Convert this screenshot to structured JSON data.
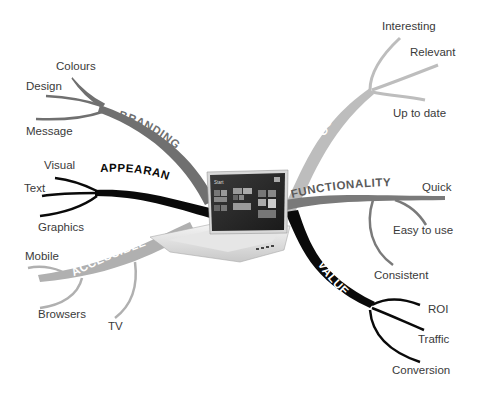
{
  "diagram": {
    "type": "mind-map",
    "center": {
      "label": "laptop",
      "screen_title": "Start"
    },
    "branches": [
      {
        "id": "branding",
        "label": "BRANDING",
        "color": "#707070",
        "text_color": "#707070",
        "children": [
          "Colours",
          "Design",
          "Message"
        ]
      },
      {
        "id": "appearance",
        "label": "APPEARANCE",
        "color": "#0a0a0a",
        "text_color": "#0a0a0a",
        "children": [
          "Visual",
          "Text",
          "Graphics"
        ]
      },
      {
        "id": "accessible",
        "label": "ACCESSIBLE",
        "color": "#b0b0b0",
        "text_color": "#ffffff",
        "children": [
          "Mobile",
          "Browsers",
          "TV"
        ]
      },
      {
        "id": "content",
        "label": "CONTENT",
        "color": "#bdbdbd",
        "text_color": "#ffffff",
        "children": [
          "Interesting",
          "Relevant",
          "Up to date"
        ]
      },
      {
        "id": "functionality",
        "label": "FUNCTIONALITY",
        "color": "#7a7a7a",
        "text_color": "#5a5a5a",
        "children": [
          "Quick",
          "Easy to use",
          "Consistent"
        ]
      },
      {
        "id": "value",
        "label": "VALUE",
        "color": "#0a0a0a",
        "text_color": "#ffffff",
        "children": [
          "ROI",
          "Traffic",
          "Conversion"
        ]
      }
    ]
  }
}
